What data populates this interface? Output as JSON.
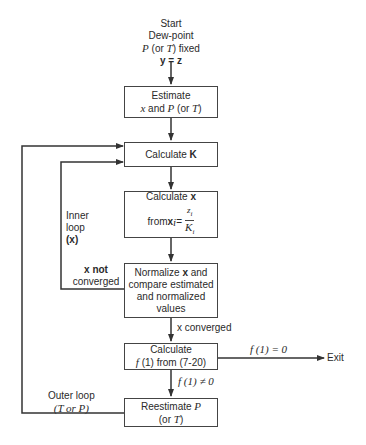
{
  "start": {
    "line1": "Start",
    "line2": "Dew-point",
    "line3_var": "P",
    "line3_mid": " (or ",
    "line3_var2": "T",
    "line3_end": ") fixed",
    "line4": "y = z"
  },
  "boxes": {
    "estimate": {
      "line1": "Estimate",
      "line2_var1": "x",
      "line2_mid": " and ",
      "line2_var2": "P",
      "line2_paren": " (or ",
      "line2_var3": "T",
      "line2_end": ")"
    },
    "calc_k": {
      "text": "Calculate ",
      "bold": "K"
    },
    "calc_x": {
      "line1": "Calculate ",
      "line1_bold": "x",
      "from": "from ",
      "xi": "x",
      "sub_i": "i",
      "eq": " = ",
      "num": "z",
      "den": "K"
    },
    "normalize": {
      "line1": "Normalize ",
      "line1_bold": "x",
      "line1_end": " and",
      "line2": "compare estimated",
      "line3": "and normalized",
      "line4": "values"
    },
    "calc_f": {
      "line1": "Calculate",
      "line2_fn": "f",
      "line2_rest": " (1) from (7-20)"
    },
    "reestimate": {
      "line1": "Reestimate ",
      "line1_var": "P",
      "line2_open": "(or ",
      "line2_var": "T",
      "line2_close": ")"
    }
  },
  "labels": {
    "inner_loop_1": "Inner",
    "inner_loop_2": "loop",
    "inner_loop_3": "(x)",
    "x_not_converged_1": "x not",
    "x_not_converged_2": "converged",
    "x_converged": "x converged",
    "f_eq_zero": "f (1) = 0",
    "f_ne_zero": "f (1) ≠ 0",
    "exit": "Exit",
    "outer_loop_1": "Outer loop",
    "outer_loop_2": "(T or P)"
  },
  "colors": {
    "line": "#333333",
    "text": "#2a2a2a",
    "background": "#ffffff"
  }
}
